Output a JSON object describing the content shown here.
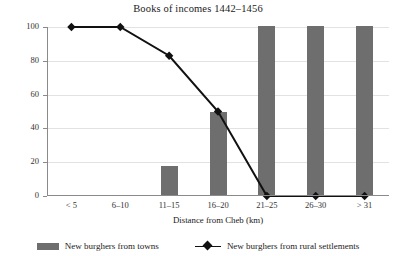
{
  "chart_data": {
    "type": "bar",
    "title": "Books of incomes 1442–1456",
    "xlabel": "Distance from Cheb (km)",
    "ylabel": "New burghers (%)",
    "categories": [
      "< 5",
      "6–10",
      "11–15",
      "16–20",
      "21–25",
      "26–30",
      "> 31"
    ],
    "ylim": [
      0,
      100
    ],
    "yticks": [
      0,
      20,
      40,
      60,
      80,
      100
    ],
    "ytick_labels": [
      "0",
      "20",
      "40",
      "60",
      "80",
      "100"
    ],
    "grid": true,
    "legend_position": "bottom",
    "series": [
      {
        "name": "New burghers from towns",
        "type": "bar",
        "color": "#6e6e6e",
        "values": [
          0,
          0,
          17,
          49,
          100,
          100,
          100
        ]
      },
      {
        "name": "New burghers from rural settlements",
        "type": "line",
        "color": "#111111",
        "marker": "diamond",
        "values": [
          100,
          100,
          83,
          50,
          0,
          0,
          0
        ]
      }
    ]
  },
  "legend": {
    "bar_entry": "New burghers from towns",
    "line_entry": "New burghers from rural settlements"
  }
}
